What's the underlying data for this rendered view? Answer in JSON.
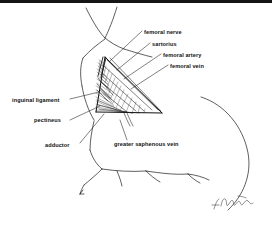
{
  "figure": {
    "type": "anatomical-line-drawing",
    "background_color": "#ffffff",
    "ink_color": "#111111",
    "top_rule_color": "#151515"
  },
  "labels": {
    "femoral_nerve": "femoral nerve",
    "sartorius": "sartorius",
    "femoral_artery": "femoral artery",
    "femoral_vein": "femoral vein",
    "inguinal_ligament": "inguinal ligament",
    "pectineus": "pectineus",
    "adductor": "adductor",
    "greater_saphenous_vein": "greater saphenous vein"
  },
  "signature": {
    "text": "T. Banasik",
    "position": "bottom-right"
  }
}
